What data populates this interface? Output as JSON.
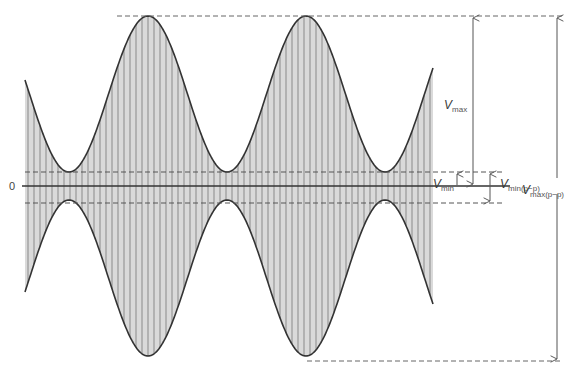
{
  "diagram": {
    "type": "amplitude-modulated-waveform",
    "axis_label": "0",
    "labels": {
      "vmax": {
        "symbol": "V",
        "subscript": "max"
      },
      "vmin": {
        "symbol": "V",
        "subscript": "min"
      },
      "vmin_pp": {
        "symbol": "V",
        "subscript": "min(p−p)"
      },
      "vmax_pp": {
        "symbol": "V",
        "subscript": "max(p−p)"
      }
    },
    "geometry": {
      "zero_y": 186,
      "envelope_max_offset": 170,
      "envelope_min_offset": 14,
      "x_start": 25,
      "x_end": 433,
      "peak_x": [
        148,
        306
      ],
      "trough_x": [
        65,
        228,
        390
      ],
      "period_px": 158,
      "carrier_line_spacing_px": 6
    },
    "colors": {
      "envelope": "#333333",
      "fill": "#dadada",
      "carrier_lines": "#8a8a8a",
      "dashed": "#666666",
      "arrows": "#555555",
      "axis": "#333333"
    }
  }
}
